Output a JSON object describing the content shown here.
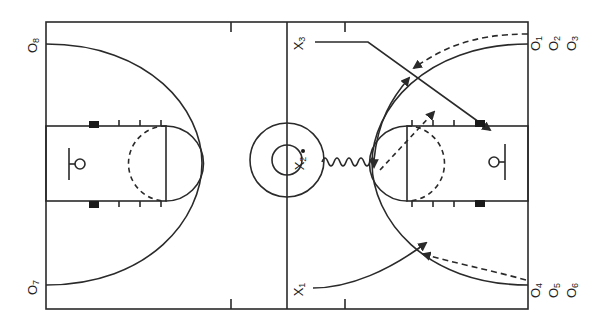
{
  "diagram": {
    "type": "basketball-play",
    "court": {
      "orientation": "horizontal",
      "line_color": "#2a2a2a",
      "background": "#ffffff"
    },
    "offense_players": [
      {
        "id": "O1",
        "letter": "O",
        "num": "1",
        "position": "right baseline top"
      },
      {
        "id": "O2",
        "letter": "O",
        "num": "2",
        "position": "right baseline top"
      },
      {
        "id": "O3",
        "letter": "O",
        "num": "3",
        "position": "right baseline top"
      },
      {
        "id": "O4",
        "letter": "O",
        "num": "4",
        "position": "right baseline bottom"
      },
      {
        "id": "O5",
        "letter": "O",
        "num": "5",
        "position": "right baseline bottom"
      },
      {
        "id": "O6",
        "letter": "O",
        "num": "6",
        "position": "right baseline bottom"
      },
      {
        "id": "O7",
        "letter": "O",
        "num": "7",
        "position": "left baseline bottom"
      },
      {
        "id": "O8",
        "letter": "O",
        "num": "8",
        "position": "left baseline top"
      }
    ],
    "defense_players": [
      {
        "id": "X1",
        "letter": "X",
        "num": "1",
        "position": "bottom near half-court"
      },
      {
        "id": "X2",
        "letter": "X",
        "num": "2",
        "position": "center circle, with ball"
      },
      {
        "id": "X3",
        "letter": "X",
        "num": "3",
        "position": "top near half-court"
      }
    ],
    "movements": [
      {
        "from": "X3",
        "type": "cut",
        "description": "X3 runs along top then diagonally to right lane block"
      },
      {
        "from": "X2",
        "type": "dribble",
        "description": "X2 dribbles from center circle to top of right key"
      },
      {
        "from": "X1",
        "type": "cut",
        "description": "X1 curves toward right wing"
      },
      {
        "from": "O1",
        "type": "pass",
        "description": "dashed pass from top-right corner to right wing"
      },
      {
        "from": "O4",
        "type": "pass",
        "description": "dashed pass from bottom-right corner to right wing"
      },
      {
        "from": "X2",
        "type": "pass",
        "description": "dashed pass from top of key to right elbow"
      }
    ]
  }
}
